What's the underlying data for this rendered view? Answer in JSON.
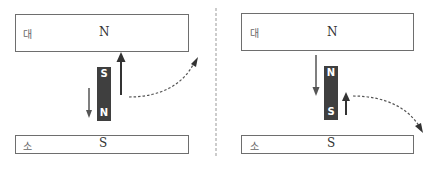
{
  "panels": [
    {
      "id": "left",
      "top_box": {
        "size_label": "대",
        "pole": "N"
      },
      "bottom_box": {
        "size_label": "소",
        "pole": "S"
      },
      "magnet": {
        "top_pole": "S",
        "bottom_pole": "N"
      },
      "arrows": {
        "large": "up",
        "small": "down",
        "curve": "up-right"
      }
    },
    {
      "id": "right",
      "top_box": {
        "size_label": "대",
        "pole": "N"
      },
      "bottom_box": {
        "size_label": "소",
        "pole": "S"
      },
      "magnet": {
        "top_pole": "N",
        "bottom_pole": "S"
      },
      "arrows": {
        "large": "down",
        "small": "up",
        "curve": "down-right"
      }
    }
  ],
  "colors": {
    "magnet": "#3f3f3f",
    "arrow": "#333333",
    "border": "#6e6e6e",
    "divider": "#999999"
  }
}
